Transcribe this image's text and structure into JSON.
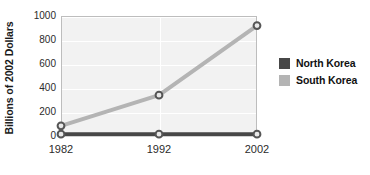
{
  "chart_data": {
    "type": "line",
    "title": "",
    "xlabel": "",
    "ylabel": "Billions of 2002 Dollars",
    "categories": [
      "1982",
      "1992",
      "2002"
    ],
    "x": [
      1982,
      1992,
      2002
    ],
    "series": [
      {
        "name": "North Korea",
        "values": [
          15,
          15,
          15
        ],
        "color": "#474747"
      },
      {
        "name": "South Korea",
        "values": [
          85,
          340,
          920
        ],
        "color": "#b4b4b4"
      }
    ],
    "ylim": [
      0,
      1000
    ],
    "y_ticks": [
      "1000",
      "800",
      "600",
      "400",
      "200",
      "0"
    ],
    "y_tick_values": [
      1000,
      800,
      600,
      400,
      200,
      0
    ],
    "grid": "horizontal-and-vertical",
    "grid_color": "#ffffff",
    "plot_background": "#f2f2f2",
    "plot_border_color": "#bdbdbd",
    "legend_position": "right",
    "marker": "circle",
    "marker_face_color": "#e8e8e8",
    "marker_edge_color": "#555555"
  },
  "legend": {
    "entries": [
      {
        "label": "North Korea",
        "color": "#474747"
      },
      {
        "label": "South Korea",
        "color": "#b4b4b4"
      }
    ]
  },
  "axis": {
    "y_title": "Billions of 2002 Dollars",
    "y_ticks": [
      "1000",
      "800",
      "600",
      "400",
      "200",
      "0"
    ],
    "x_ticks": [
      "1982",
      "1992",
      "2002"
    ]
  }
}
